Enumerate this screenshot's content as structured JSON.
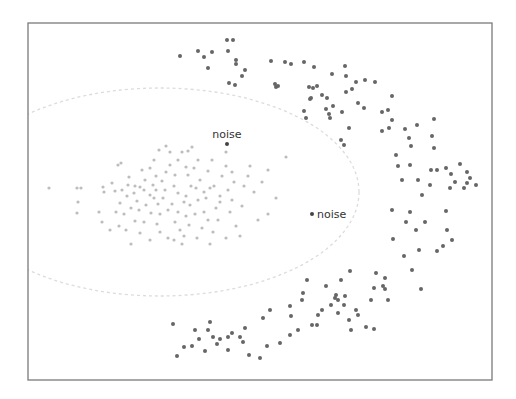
{
  "chart_data": {
    "type": "scatter",
    "title": "",
    "xlabel": "",
    "ylabel": "",
    "grid": false,
    "legend": null,
    "frame": {
      "x": 28,
      "y": 23,
      "width": 464,
      "height": 357
    },
    "colors": {
      "frame": "#7a7a7a",
      "cluster_inner": "#bdbdbd",
      "cluster_outer": "#666666",
      "noise": "#444444",
      "ellipse": "#dcdcdc",
      "label": "#333333"
    },
    "boundary_ellipse": {
      "cx": 160,
      "cy": 192,
      "rx": 199,
      "ry": 104,
      "style": "dashed"
    },
    "annotations": [
      {
        "text": "noise",
        "x": 227,
        "y": 144,
        "label_position": "above"
      },
      {
        "text": "noise",
        "x": 312,
        "y": 214,
        "label_position": "right"
      }
    ],
    "series": [
      {
        "name": "inner-cluster",
        "color": "#bdbdbd",
        "radius": 1.6,
        "points": [
          [
            49,
            188
          ],
          [
            77,
            188
          ],
          [
            81,
            188
          ],
          [
            78,
            202
          ],
          [
            77,
            213
          ],
          [
            99,
            212
          ],
          [
            103,
            187
          ],
          [
            104,
            192
          ],
          [
            112,
            183
          ],
          [
            115,
            191
          ],
          [
            122,
            190
          ],
          [
            118,
            165
          ],
          [
            121,
            163
          ],
          [
            129,
            177
          ],
          [
            128,
            185
          ],
          [
            127,
            196
          ],
          [
            120,
            203
          ],
          [
            116,
            212
          ],
          [
            124,
            214
          ],
          [
            131,
            208
          ],
          [
            135,
            221
          ],
          [
            137,
            201
          ],
          [
            134,
            193
          ],
          [
            140,
            187
          ],
          [
            145,
            180
          ],
          [
            142,
            170
          ],
          [
            150,
            168
          ],
          [
            154,
            160
          ],
          [
            156,
            176
          ],
          [
            153,
            185
          ],
          [
            150,
            195
          ],
          [
            146,
            205
          ],
          [
            151,
            213
          ],
          [
            144,
            222
          ],
          [
            140,
            233
          ],
          [
            119,
            226
          ],
          [
            131,
            244
          ],
          [
            157,
            224
          ],
          [
            160,
            232
          ],
          [
            158,
            204
          ],
          [
            163,
            198
          ],
          [
            165,
            190
          ],
          [
            162,
            181
          ],
          [
            166,
            172
          ],
          [
            170,
            165
          ],
          [
            175,
            175
          ],
          [
            174,
            186
          ],
          [
            178,
            193
          ],
          [
            172,
            204
          ],
          [
            178,
            212
          ],
          [
            175,
            222
          ],
          [
            180,
            230
          ],
          [
            174,
            240
          ],
          [
            168,
            238
          ],
          [
            184,
            236
          ],
          [
            189,
            225
          ],
          [
            186,
            216
          ],
          [
            190,
            205
          ],
          [
            186,
            196
          ],
          [
            191,
            186
          ],
          [
            188,
            175
          ],
          [
            194,
            168
          ],
          [
            198,
            160
          ],
          [
            200,
            180
          ],
          [
            204,
            192
          ],
          [
            198,
            200
          ],
          [
            204,
            212
          ],
          [
            208,
            220
          ],
          [
            202,
            228
          ],
          [
            197,
            238
          ],
          [
            210,
            244
          ],
          [
            213,
            232
          ],
          [
            218,
            220
          ],
          [
            216,
            208
          ],
          [
            220,
            196
          ],
          [
            214,
            186
          ],
          [
            222,
            176
          ],
          [
            226,
            166
          ],
          [
            232,
            172
          ],
          [
            228,
            190
          ],
          [
            232,
            200
          ],
          [
            230,
            212
          ],
          [
            236,
            226
          ],
          [
            240,
            236
          ],
          [
            226,
            238
          ],
          [
            208,
            171
          ],
          [
            212,
            160
          ],
          [
            192,
            147
          ],
          [
            188,
            151
          ],
          [
            182,
            152
          ],
          [
            159,
            150
          ],
          [
            196,
            188
          ],
          [
            156,
            190
          ],
          [
            135,
            186
          ],
          [
            160,
            214
          ],
          [
            144,
            190
          ],
          [
            168,
            210
          ],
          [
            184,
            202
          ],
          [
            206,
            198
          ],
          [
            220,
            202
          ],
          [
            242,
            206
          ],
          [
            244,
            186
          ],
          [
            248,
            176
          ],
          [
            250,
            166
          ],
          [
            254,
            192
          ],
          [
            262,
            182
          ],
          [
            268,
            170
          ],
          [
            276,
            198
          ],
          [
            286,
            157
          ],
          [
            268,
            214
          ],
          [
            258,
            220
          ],
          [
            186,
            167
          ],
          [
            178,
            160
          ],
          [
            226,
            152
          ],
          [
            170,
            152
          ],
          [
            166,
            146
          ],
          [
            110,
            230
          ],
          [
            126,
            230
          ],
          [
            102,
            222
          ],
          [
            210,
            188
          ],
          [
            150,
            240
          ],
          [
            182,
            244
          ],
          [
            195,
            214
          ],
          [
            139,
            210
          ],
          [
            154,
            198
          ],
          [
            234,
            182
          ]
        ]
      },
      {
        "name": "outer-arc-cluster",
        "color": "#666666",
        "radius": 2,
        "points": [
          [
            180,
            56
          ],
          [
            198,
            51
          ],
          [
            204,
            57
          ],
          [
            212,
            52
          ],
          [
            208,
            68
          ],
          [
            227,
            40
          ],
          [
            233,
            40
          ],
          [
            228,
            51
          ],
          [
            236,
            60
          ],
          [
            236,
            64
          ],
          [
            242,
            76
          ],
          [
            229,
            83
          ],
          [
            235,
            85
          ],
          [
            245,
            70
          ],
          [
            271,
            61
          ],
          [
            285,
            62
          ],
          [
            291,
            64
          ],
          [
            304,
            62
          ],
          [
            278,
            86
          ],
          [
            276,
            87
          ],
          [
            275,
            84
          ],
          [
            314,
            67
          ],
          [
            332,
            74
          ],
          [
            309,
            87
          ],
          [
            313,
            88
          ],
          [
            317,
            86
          ],
          [
            311,
            98
          ],
          [
            310,
            99
          ],
          [
            306,
            118
          ],
          [
            322,
            95
          ],
          [
            327,
            98
          ],
          [
            346,
            76
          ],
          [
            345,
            66
          ],
          [
            330,
            118
          ],
          [
            326,
            109
          ],
          [
            304,
            111
          ],
          [
            329,
            114
          ],
          [
            333,
            106
          ],
          [
            342,
            112
          ],
          [
            346,
            92
          ],
          [
            352,
            89
          ],
          [
            356,
            82
          ],
          [
            349,
            128
          ],
          [
            344,
            145
          ],
          [
            341,
            140
          ],
          [
            358,
            103
          ],
          [
            364,
            108
          ],
          [
            365,
            80
          ],
          [
            382,
            112
          ],
          [
            375,
            82
          ],
          [
            388,
            110
          ],
          [
            382,
            131
          ],
          [
            389,
            128
          ],
          [
            392,
            96
          ],
          [
            392,
            120
          ],
          [
            396,
            155
          ],
          [
            398,
            166
          ],
          [
            405,
            129
          ],
          [
            417,
            125
          ],
          [
            409,
            138
          ],
          [
            411,
            146
          ],
          [
            432,
            136
          ],
          [
            434,
            119
          ],
          [
            431,
            170
          ],
          [
            434,
            148
          ],
          [
            437,
            170
          ],
          [
            446,
            168
          ],
          [
            451,
            174
          ],
          [
            455,
            182
          ],
          [
            467,
            183
          ],
          [
            460,
            164
          ],
          [
            470,
            178
          ],
          [
            476,
            185
          ],
          [
            450,
            188
          ],
          [
            430,
            185
          ],
          [
            422,
            195
          ],
          [
            418,
            180
          ],
          [
            402,
            180
          ],
          [
            410,
            165
          ],
          [
            464,
            188
          ],
          [
            467,
            172
          ],
          [
            392,
            210
          ],
          [
            410,
            212
          ],
          [
            425,
            222
          ],
          [
            446,
            211
          ],
          [
            447,
            230
          ],
          [
            452,
            240
          ],
          [
            437,
            251
          ],
          [
            443,
            246
          ],
          [
            416,
            230
          ],
          [
            404,
            256
          ],
          [
            412,
            270
          ],
          [
            421,
            289
          ],
          [
            406,
            222
          ],
          [
            419,
            250
          ],
          [
            393,
            239
          ],
          [
            385,
            289
          ],
          [
            376,
            273
          ],
          [
            350,
            271
          ],
          [
            341,
            280
          ],
          [
            338,
            300
          ],
          [
            345,
            296
          ],
          [
            335,
            298
          ],
          [
            326,
            286
          ],
          [
            307,
            280
          ],
          [
            303,
            293
          ],
          [
            290,
            306
          ],
          [
            263,
            318
          ],
          [
            270,
            310
          ],
          [
            291,
            316
          ],
          [
            302,
            300
          ],
          [
            336,
            295
          ],
          [
            344,
            305
          ],
          [
            356,
            310
          ],
          [
            371,
            300
          ],
          [
            374,
            288
          ],
          [
            338,
            313
          ],
          [
            349,
            320
          ],
          [
            358,
            315
          ],
          [
            366,
            327
          ],
          [
            351,
            330
          ],
          [
            374,
            329
          ],
          [
            383,
            286
          ],
          [
            385,
            278
          ],
          [
            388,
            300
          ],
          [
            173,
            324
          ],
          [
            177,
            356
          ],
          [
            184,
            347
          ],
          [
            192,
            346
          ],
          [
            199,
            339
          ],
          [
            195,
            330
          ],
          [
            208,
            330
          ],
          [
            210,
            322
          ],
          [
            205,
            351
          ],
          [
            213,
            337
          ],
          [
            217,
            344
          ],
          [
            220,
            339
          ],
          [
            228,
            337
          ],
          [
            228,
            350
          ],
          [
            240,
            337
          ],
          [
            243,
            342
          ],
          [
            232,
            333
          ],
          [
            245,
            328
          ],
          [
            249,
            355
          ],
          [
            260,
            358
          ],
          [
            267,
            346
          ],
          [
            280,
            343
          ],
          [
            290,
            335
          ],
          [
            298,
            330
          ],
          [
            312,
            325
          ],
          [
            318,
            315
          ],
          [
            322,
            310
          ],
          [
            331,
            305
          ],
          [
            317,
            325
          ]
        ]
      },
      {
        "name": "noise",
        "color": "#444444",
        "radius": 2,
        "points": [
          [
            227,
            144
          ],
          [
            312,
            214
          ]
        ]
      }
    ]
  }
}
